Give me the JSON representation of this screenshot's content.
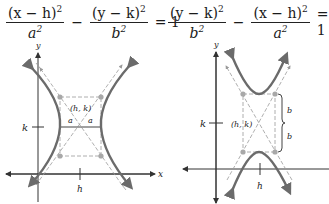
{
  "left_equation": {
    "term1_numerator": "(x − h)",
    "term1_denominator": "a",
    "operator": "−",
    "term2_numerator": "(y − k)",
    "term2_denominator": "b",
    "exponent": "2",
    "equals": "= 1"
  },
  "right_equation": {
    "term1_numerator": "(y − k)",
    "term1_denominator": "b",
    "operator": "−",
    "term2_numerator": "(x − h)",
    "term2_denominator": "a",
    "exponent": "2",
    "equals": "= 1"
  },
  "left_graph": {
    "type": "horizontal-transverse-axis hyperbola",
    "y_axis_label": "y",
    "x_axis_label": "x",
    "center_label": "(h, k)",
    "k_label": "k",
    "h_label": "h",
    "semi_axis_labels": [
      "a",
      "a"
    ]
  },
  "right_graph": {
    "type": "vertical-transverse-axis hyperbola",
    "y_axis_label": "y",
    "center_label": "(h, k)",
    "k_label": "k",
    "h_label": "h",
    "semi_axis_labels": [
      "b",
      "b"
    ]
  },
  "colors": {
    "curve": "#6b6b6b",
    "asymptote": "#9a9a9a",
    "vertex_dot": "#a8a8a8",
    "axis": "#333333"
  }
}
